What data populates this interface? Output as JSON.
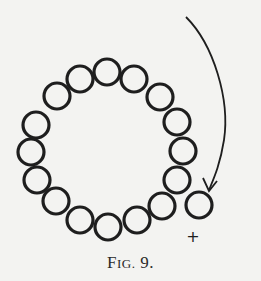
{
  "figure": {
    "caption_big": "F",
    "caption_small": "IG.",
    "caption_num": " 9.",
    "caption_full": "Fig. 9.",
    "plus_sign": "+",
    "stroke_color": "#1e1e1e",
    "background": "#f3f3f1",
    "circle_radius": 13,
    "ring_circles": [
      [
        107,
        72
      ],
      [
        80,
        79
      ],
      [
        57,
        96
      ],
      [
        36,
        125
      ],
      [
        31,
        152
      ],
      [
        37,
        180
      ],
      [
        56,
        201
      ],
      [
        80,
        220
      ],
      [
        108,
        227
      ],
      [
        137,
        220
      ],
      [
        162,
        206
      ],
      [
        177,
        180
      ],
      [
        183,
        151
      ],
      [
        177,
        122
      ],
      [
        160,
        97
      ],
      [
        134,
        79
      ]
    ],
    "detached_circle": [
      199,
      205
    ],
    "arrow": {
      "start": [
        186,
        17
      ],
      "end": [
        210,
        190
      ]
    },
    "plus_position": [
      193,
      236
    ]
  }
}
